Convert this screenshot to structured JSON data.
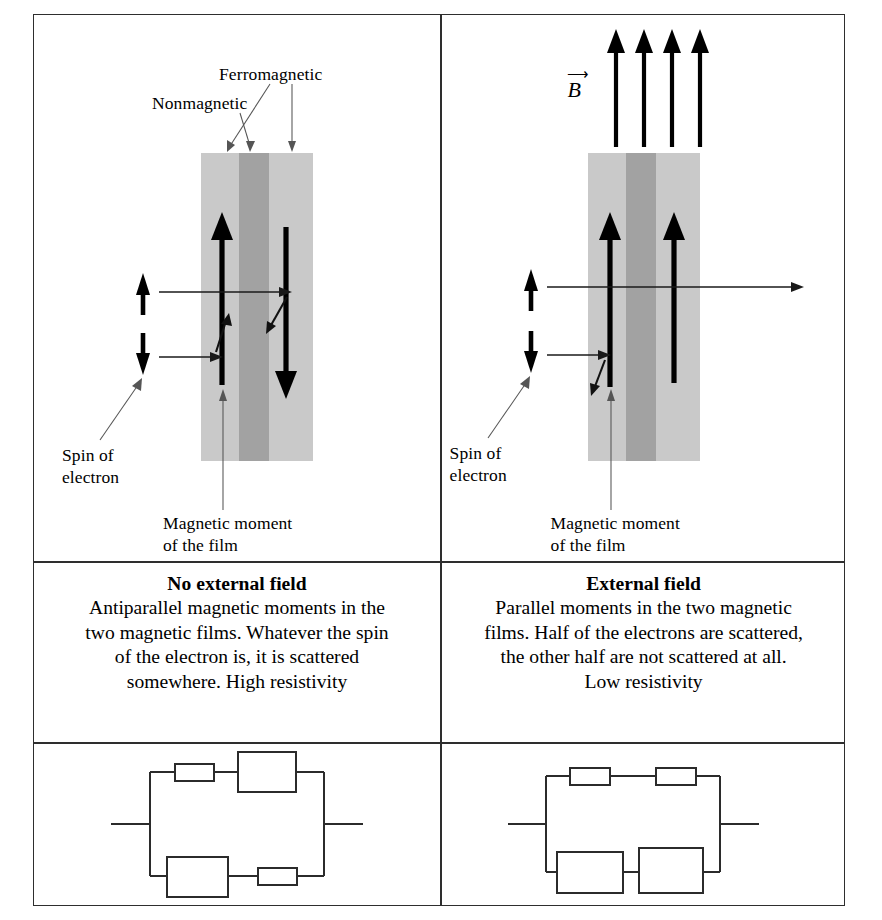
{
  "figure": {
    "domain_title": "Giant magnetoresistance spin valve diagram",
    "caption": ""
  },
  "panels": [
    {
      "id": "no-field",
      "labels": {
        "ferromagnetic": "Ferromagnetic",
        "nonmagnetic": "Nonmagnetic",
        "spin_of_electron_line1": "Spin of",
        "spin_of_electron_line2": "electron",
        "magnetic_moment_line1": "Magnetic moment",
        "magnetic_moment_line2": "of the film"
      },
      "field_symbol": "",
      "moments": [
        "up",
        "down"
      ],
      "moment_description": "antiparallel",
      "spins": [
        "up",
        "down"
      ],
      "text": {
        "heading": "No external field",
        "line1": "Antiparallel magnetic moments in the",
        "line2": "two magnetic films. Whatever the spin",
        "line3": "of the electron is, it is scattered",
        "line4": "somewhere. High resistivity"
      },
      "circuit": {
        "type": "two-parallel-branches",
        "top_branch": [
          "small",
          "large"
        ],
        "bottom_branch": [
          "large",
          "small"
        ]
      }
    },
    {
      "id": "external-field",
      "labels": {
        "spin_of_electron_line1": "Spin of",
        "spin_of_electron_line2": "electron",
        "magnetic_moment_line1": "Magnetic moment",
        "magnetic_moment_line2": "of the film"
      },
      "field_symbol": "B",
      "field_arrow_count": 4,
      "moments": [
        "up",
        "up"
      ],
      "moment_description": "parallel",
      "spins": [
        "up",
        "down"
      ],
      "text": {
        "heading": "External field",
        "line1": "Parallel moments in the two magnetic",
        "line2": "films. Half of the electrons are scattered,",
        "line3": "the other half are not scattered at all.",
        "line4": "Low resistivity"
      },
      "circuit": {
        "type": "two-parallel-branches",
        "top_branch": [
          "small",
          "small"
        ],
        "bottom_branch": [
          "large",
          "large"
        ]
      }
    }
  ],
  "colors": {
    "ferromagnetic_film": "#c9c9c9",
    "nonmagnetic_film": "#a2a2a2",
    "border": "#2e2e2e",
    "ink": "#000000"
  }
}
